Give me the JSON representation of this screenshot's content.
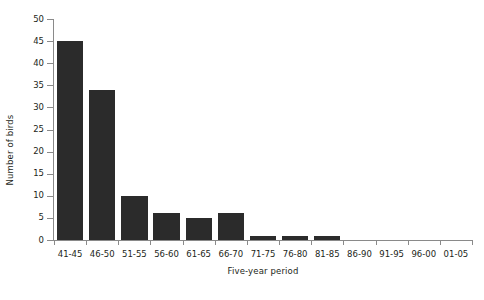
{
  "chart_data": {
    "type": "bar",
    "title": "",
    "xlabel": "Five-year period",
    "ylabel": "Number of birds",
    "categories": [
      "41-45",
      "46-50",
      "51-55",
      "56-60",
      "61-65",
      "66-70",
      "71-75",
      "76-80",
      "81-85",
      "86-90",
      "91-95",
      "96-00",
      "01-05"
    ],
    "values": [
      45,
      34,
      10,
      6,
      5,
      6,
      1,
      1,
      1,
      0,
      0,
      0,
      0
    ],
    "ylim": [
      0,
      50
    ],
    "yticks": [
      0,
      5,
      10,
      15,
      20,
      25,
      30,
      35,
      40,
      45,
      50
    ],
    "ytick_labels": [
      "0",
      "5",
      "10",
      "15",
      "20",
      "25",
      "30",
      "35",
      "40",
      "45",
      "50"
    ],
    "grid": false,
    "legend": null,
    "bar_color": "#2b2b2b",
    "axis_color": "#8a8a8a",
    "text_color": "#231f20",
    "background": "#ffffff"
  }
}
